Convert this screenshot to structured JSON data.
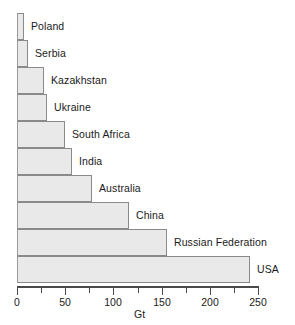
{
  "chart_data": {
    "type": "bar",
    "orientation": "horizontal",
    "title": "",
    "subtitle": "",
    "xlabel": "Gt",
    "ylabel": "",
    "xlim": [
      0,
      250
    ],
    "ylim": null,
    "grid": false,
    "legend": null,
    "legend_position": "none",
    "xticks": [
      0,
      50,
      100,
      150,
      200,
      250
    ],
    "xtick_labels": [
      "0",
      "50",
      "100",
      "150",
      "200",
      "250"
    ],
    "minor_xticks": [
      25,
      75,
      125,
      175,
      225
    ],
    "categories": [
      "Poland",
      "Serbia",
      "Kazakhstan",
      "Ukraine",
      "South Africa",
      "India",
      "Australia",
      "China",
      "Russian Federation",
      "USA"
    ],
    "values": [
      7,
      11,
      28,
      31,
      50,
      57,
      78,
      116,
      156,
      242
    ],
    "bars": [
      {
        "label": "Poland",
        "value": 7
      },
      {
        "label": "Serbia",
        "value": 11
      },
      {
        "label": "Kazakhstan",
        "value": 28
      },
      {
        "label": "Ukraine",
        "value": 31
      },
      {
        "label": "South Africa",
        "value": 50
      },
      {
        "label": "India",
        "value": 57
      },
      {
        "label": "Australia",
        "value": 78
      },
      {
        "label": "China",
        "value": 116
      },
      {
        "label": "Russian Federation",
        "value": 156
      },
      {
        "label": "USA",
        "value": 242
      }
    ],
    "colors": {
      "bar_fill": "#e9e9e9",
      "bar_border": "#8a8a8a",
      "axis": "#4a4a4a",
      "text": "#1a1a1a",
      "background": "#ffffff"
    }
  }
}
